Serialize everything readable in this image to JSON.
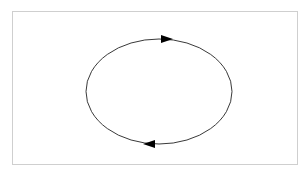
{
  "diagram": {
    "type": "cycle",
    "shape": "ellipse",
    "direction": "clockwise",
    "ellipse": {
      "cx": 159,
      "cy": 91.5,
      "rx": 73,
      "ry": 52.5
    },
    "stroke_color": "#222222",
    "frame_color": "#cfcfcf",
    "arrows": [
      {
        "name": "top-arrow",
        "position": "top",
        "points": "right",
        "x": 167,
        "y": 39
      },
      {
        "name": "bottom-arrow",
        "position": "bottom",
        "points": "left",
        "x": 149,
        "y": 144
      }
    ]
  }
}
